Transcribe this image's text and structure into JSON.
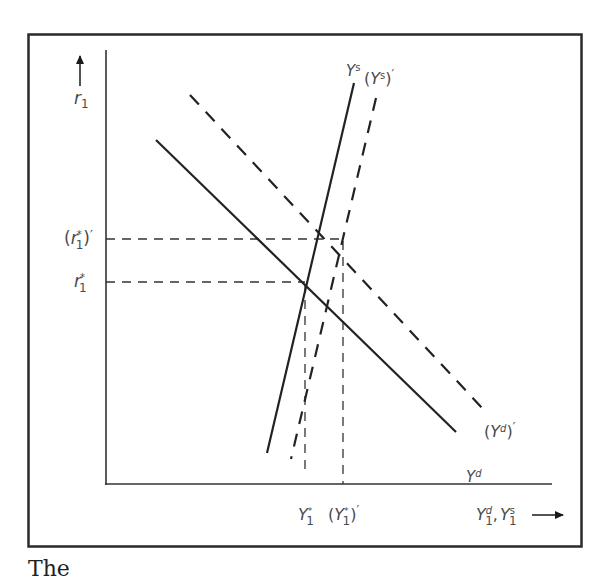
{
  "figure": {
    "frame": {
      "x": 28,
      "y": 34,
      "width": 554,
      "height": 513,
      "color": "#2a2a2a"
    },
    "axes": {
      "y_axis_label": "r",
      "y_axis_label_sub": "1",
      "x_axis_label_d": "Y",
      "x_axis_label_d_sup": "d",
      "x_axis_label_d_sub": "1",
      "x_axis_label_sep": ",",
      "x_axis_label_s": "Y",
      "x_axis_label_s_sup": "s",
      "x_axis_label_s_sub": "1"
    },
    "curves": {
      "Ys": {
        "label": "Y",
        "sup": "s",
        "style": "solid"
      },
      "Ys_prime": {
        "open": "(",
        "label": "Y",
        "sup": "s",
        "close": ")",
        "prime": "′",
        "style": "dashed"
      },
      "Yd": {
        "label": "Y",
        "sup": "d",
        "style": "solid"
      },
      "Yd_prime": {
        "open": "(",
        "label": "Y",
        "sup": "d",
        "close": ")",
        "prime": "′",
        "style": "dashed"
      }
    },
    "y_ticks": {
      "r1_star": {
        "label": "r",
        "sup": "*",
        "sub": "1"
      },
      "r1_star_prime": {
        "open": "(",
        "label": "r",
        "sup": "*",
        "sub": "1",
        "close": ")",
        "prime": "′"
      }
    },
    "x_ticks": {
      "Y1_star": {
        "label": "Y",
        "sup": "*",
        "sub": "1"
      },
      "Y1_star_prime": {
        "open": "(",
        "label": "Y",
        "sup": "*",
        "sub": "1",
        "close": ")",
        "prime": "′"
      }
    }
  },
  "caption": {
    "text": "The"
  }
}
